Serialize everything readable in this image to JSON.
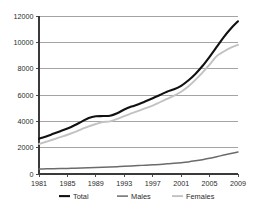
{
  "chart_data": {
    "type": "line",
    "title": "",
    "subtitle": "",
    "xlabel": "",
    "ylabel": "",
    "xlim": [
      1981,
      2009
    ],
    "ylim": [
      0,
      12000
    ],
    "grid": "horizontal",
    "legend_position": "bottom",
    "x_tick_labels": [
      "1981",
      "1985",
      "1989",
      "1993",
      "1997",
      "2001",
      "2005",
      "2009"
    ],
    "x_ticks": [
      1981,
      1985,
      1989,
      1993,
      1997,
      2001,
      2005,
      2009
    ],
    "y_tick_labels": [
      "0",
      "2000",
      "4000",
      "6000",
      "8000",
      "10000",
      "12000"
    ],
    "y_ticks": [
      0,
      2000,
      4000,
      6000,
      8000,
      10000,
      12000
    ],
    "x": [
      1981,
      1982,
      1983,
      1984,
      1985,
      1986,
      1987,
      1988,
      1989,
      1990,
      1991,
      1992,
      1993,
      1994,
      1995,
      1996,
      1997,
      1998,
      1999,
      2000,
      2001,
      2002,
      2003,
      2004,
      2005,
      2006,
      2007,
      2008,
      2009
    ],
    "series": [
      {
        "name": "Total",
        "color": "#111111",
        "width": 2.1,
        "values": [
          2680,
          2850,
          3050,
          3250,
          3450,
          3700,
          3980,
          4250,
          4380,
          4400,
          4430,
          4620,
          4900,
          5120,
          5300,
          5520,
          5750,
          6000,
          6250,
          6430,
          6700,
          7100,
          7600,
          8200,
          8900,
          9650,
          10400,
          11050,
          11600
        ]
      },
      {
        "name": "Males",
        "color": "#6b6b6b",
        "width": 1.5,
        "values": [
          380,
          390,
          400,
          410,
          420,
          440,
          460,
          480,
          500,
          520,
          540,
          560,
          580,
          610,
          640,
          670,
          700,
          730,
          770,
          810,
          860,
          920,
          1000,
          1090,
          1190,
          1310,
          1440,
          1560,
          1670
        ]
      },
      {
        "name": "Females",
        "color": "#c2c2c2",
        "width": 1.9,
        "values": [
          2280,
          2450,
          2620,
          2800,
          2980,
          3180,
          3400,
          3620,
          3800,
          3950,
          4000,
          4180,
          4400,
          4600,
          4800,
          5000,
          5200,
          5450,
          5700,
          5950,
          6250,
          6650,
          7150,
          7700,
          8300,
          8950,
          9300,
          9600,
          9800
        ]
      }
    ],
    "legend": [
      {
        "label": "Total",
        "color": "#111111",
        "width": 2.1
      },
      {
        "label": "Males",
        "color": "#6b6b6b",
        "width": 1.5
      },
      {
        "label": "Females",
        "color": "#c2c2c2",
        "width": 1.9
      }
    ]
  }
}
